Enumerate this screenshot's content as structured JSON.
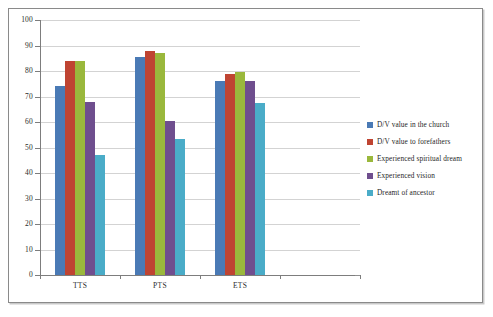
{
  "chart_data": {
    "type": "bar",
    "title": "",
    "xlabel": "",
    "ylabel": "",
    "ylim": [
      0,
      100
    ],
    "ytick_step": 10,
    "yticks": [
      0,
      10,
      20,
      30,
      40,
      50,
      60,
      70,
      80,
      90,
      100
    ],
    "ytick_labels": [
      "0",
      "10",
      "20",
      "30",
      "40",
      "50",
      "60",
      "70",
      "80",
      "90",
      "100"
    ],
    "grid": true,
    "legend_position": "right",
    "categories": [
      "TTS",
      "PTS",
      "ETS"
    ],
    "series": [
      {
        "name": "D/V value in the church",
        "color": "#4a7ab5",
        "values": [
          74,
          85.5,
          76
        ]
      },
      {
        "name": "D/V value to forefathers",
        "color": "#bf4432",
        "values": [
          84,
          88,
          79
        ]
      },
      {
        "name": "Experienced spiritual dream",
        "color": "#9ab83c",
        "values": [
          84,
          87,
          79.5
        ]
      },
      {
        "name": "Experienced vision",
        "color": "#6f4e8e",
        "values": [
          68,
          60.5,
          76
        ]
      },
      {
        "name": "Dreamt of ancestor",
        "color": "#4aacc8",
        "values": [
          47,
          53.5,
          67.5
        ]
      }
    ]
  },
  "legend": {
    "items": [
      {
        "label": "D/V value in the church",
        "color": "#4a7ab5"
      },
      {
        "label": "D/V value to forefathers",
        "color": "#bf4432"
      },
      {
        "label": "Experienced spiritual dream",
        "color": "#9ab83c"
      },
      {
        "label": "Experienced vision",
        "color": "#6f4e8e"
      },
      {
        "label": "Dreamt of ancestor",
        "color": "#4aacc8"
      }
    ]
  }
}
